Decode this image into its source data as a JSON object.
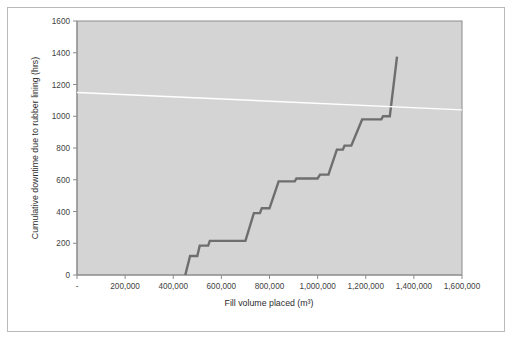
{
  "chart_data": {
    "type": "line",
    "title": "",
    "xlabel": "Fill volume placed (m³)",
    "ylabel": "Cumulative downtime due to rubber lining (hrs)",
    "xlim": [
      0,
      1600000
    ],
    "ylim": [
      0,
      1600
    ],
    "grid": false,
    "legend_position": "none",
    "plot_background_color": "#d4d4d4",
    "xtick_labels": [
      "-",
      "200,000",
      "400,000",
      "600,000",
      "800,000",
      "1,000,000",
      "1,200,000",
      "1,400,000",
      "1,600,000"
    ],
    "xtick_values": [
      0,
      200000,
      400000,
      600000,
      800000,
      1000000,
      1200000,
      1400000,
      1600000
    ],
    "ytick_labels": [
      "0",
      "200",
      "400",
      "600",
      "800",
      "1000",
      "1200",
      "1400",
      "1600"
    ],
    "ytick_values": [
      0,
      200,
      400,
      600,
      800,
      1000,
      1200,
      1400,
      1600
    ],
    "series": [
      {
        "name": "Cumulative downtime (step)",
        "color": "#6e6e6e",
        "width": 2.4,
        "style": "step",
        "points": [
          [
            450000,
            0
          ],
          [
            470000,
            120
          ],
          [
            500000,
            120
          ],
          [
            510000,
            185
          ],
          [
            545000,
            185
          ],
          [
            552000,
            215
          ],
          [
            700000,
            215
          ],
          [
            735000,
            390
          ],
          [
            760000,
            390
          ],
          [
            768000,
            420
          ],
          [
            800000,
            420
          ],
          [
            838000,
            590
          ],
          [
            905000,
            590
          ],
          [
            912000,
            608
          ],
          [
            1000000,
            608
          ],
          [
            1010000,
            632
          ],
          [
            1045000,
            632
          ],
          [
            1080000,
            790
          ],
          [
            1105000,
            790
          ],
          [
            1112000,
            815
          ],
          [
            1140000,
            815
          ],
          [
            1185000,
            980
          ],
          [
            1265000,
            980
          ],
          [
            1272000,
            1000
          ],
          [
            1300000,
            1000
          ],
          [
            1330000,
            1375
          ]
        ]
      },
      {
        "name": "Trend line",
        "color": "#ffffff",
        "width": 1.4,
        "style": "line",
        "points": [
          [
            0,
            1150
          ],
          [
            1600000,
            1040
          ]
        ]
      }
    ]
  },
  "figure": {
    "frame_color": "#b9b9b9",
    "axis_color": "#8c8c8c",
    "tick_label_color": "#3f3f3f",
    "axis_title_color": "#2d2d2d"
  }
}
